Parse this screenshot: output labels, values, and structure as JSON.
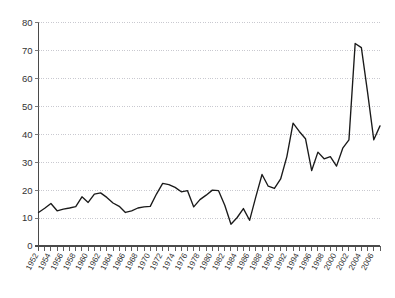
{
  "chart_data": {
    "type": "line",
    "title": "",
    "subtitle": "",
    "xlabel": "",
    "ylabel": "",
    "xlim": [
      1952,
      2007
    ],
    "ylim": [
      0,
      80
    ],
    "grid": true,
    "grid_axis": "y",
    "legend": false,
    "legend_position": "none",
    "line_color": "#1a1a1a",
    "grid_color": "#bcbcc4",
    "axis_color": "#4a4a4a",
    "y_ticks": [
      0,
      10,
      20,
      30,
      40,
      50,
      60,
      70,
      80
    ],
    "y_tick_labels": [
      "0",
      "10",
      "20",
      "30",
      "40",
      "50",
      "60",
      "70",
      "80"
    ],
    "x_tick_step": 1,
    "x_label_step": 2,
    "x_tick_labels": [
      "1952",
      "1954",
      "1956",
      "1958",
      "1960",
      "1962",
      "1964",
      "1966",
      "1968",
      "1970",
      "1972",
      "1974",
      "1976",
      "1978",
      "1980",
      "1982",
      "1984",
      "1986",
      "1988",
      "1990",
      "1992",
      "1994",
      "1996",
      "1998",
      "2000",
      "2002",
      "2004",
      "2006"
    ],
    "x": [
      1952,
      1953,
      1954,
      1955,
      1956,
      1957,
      1958,
      1959,
      1960,
      1961,
      1962,
      1963,
      1964,
      1965,
      1966,
      1967,
      1968,
      1969,
      1970,
      1971,
      1972,
      1973,
      1974,
      1975,
      1976,
      1977,
      1978,
      1979,
      1980,
      1981,
      1982,
      1983,
      1984,
      1985,
      1986,
      1987,
      1988,
      1989,
      1990,
      1991,
      1992,
      1993,
      1994,
      1995,
      1996,
      1997,
      1998,
      1999,
      2000,
      2001,
      2002,
      2003,
      2004,
      2005,
      2006,
      2007
    ],
    "values": [
      12,
      13.5,
      15.2,
      12.6,
      13.2,
      13.6,
      14.1,
      17.6,
      15.6,
      18.6,
      19,
      17.4,
      15.4,
      14.2,
      12,
      12.6,
      13.6,
      14,
      14.2,
      18.6,
      22.4,
      22,
      21,
      19.4,
      19.8,
      14,
      16.6,
      18.2,
      20,
      19.8,
      14.6,
      7.8,
      10.2,
      13.4,
      9.2,
      17.6,
      25.6,
      21.4,
      20.6,
      24,
      32,
      44,
      41,
      38.4,
      27,
      33.6,
      31.2,
      32,
      28.6,
      35,
      38,
      72.5,
      71,
      55,
      38,
      43
    ]
  }
}
